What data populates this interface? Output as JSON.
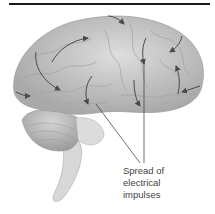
{
  "figure": {
    "label_lines": [
      "Spread of",
      "electrical",
      "impulses"
    ],
    "colors": {
      "brain_fill": "#c9c9c9",
      "brain_shade": "#a8a8a8",
      "arrow": "#4a4a4a",
      "rule": "#1a1a1a",
      "text": "#444444"
    }
  }
}
